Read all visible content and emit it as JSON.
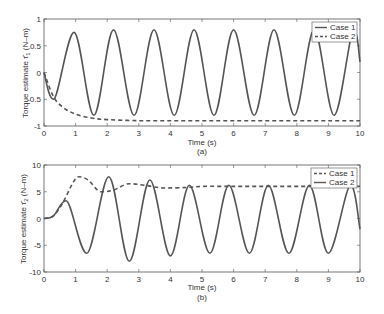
{
  "chart_data": [
    {
      "type": "line",
      "panel_label": "(a)",
      "xlabel": "Time (s)",
      "ylabel": "Torque estimate τ̂1 (N–m)",
      "xlim": [
        0,
        10
      ],
      "ylim": [
        -1,
        1
      ],
      "xticks": [
        0,
        1,
        2,
        3,
        4,
        5,
        6,
        7,
        8,
        9,
        10
      ],
      "yticks": [
        -1,
        -0.5,
        0,
        0.5,
        1
      ],
      "ytick_labels": [
        "-1",
        "-0.5",
        "0",
        "0.5",
        "1"
      ],
      "grid": false,
      "legend_position": "upper right",
      "legend": [
        "Case 1",
        "Case 2"
      ],
      "series": [
        {
          "name": "Case 1",
          "style": "solid",
          "x": [
            0,
            0.3,
            0.95,
            1.58,
            2.2,
            2.85,
            3.48,
            4.12,
            4.75,
            5.38,
            6.0,
            6.65,
            7.28,
            7.92,
            8.55,
            9.18,
            9.8,
            10
          ],
          "y": [
            0,
            -0.5,
            0.75,
            -0.8,
            0.8,
            -0.8,
            0.8,
            -0.8,
            0.8,
            -0.8,
            0.8,
            -0.8,
            0.8,
            -0.8,
            0.8,
            -0.8,
            0.8,
            0.2
          ]
        },
        {
          "name": "Case 2",
          "style": "dashed",
          "x": [
            0,
            0.3,
            0.6,
            1.0,
            1.5,
            2,
            3,
            4,
            5,
            6,
            7,
            8,
            9,
            10
          ],
          "y": [
            0,
            -0.45,
            -0.65,
            -0.78,
            -0.85,
            -0.88,
            -0.9,
            -0.9,
            -0.9,
            -0.9,
            -0.9,
            -0.9,
            -0.9,
            -0.9
          ]
        }
      ]
    },
    {
      "type": "line",
      "panel_label": "(b)",
      "xlabel": "Time (s)",
      "ylabel": "Torque estimate τ̂2 (N–m)",
      "xlim": [
        0,
        10
      ],
      "ylim": [
        -10,
        10
      ],
      "xticks": [
        0,
        1,
        2,
        3,
        4,
        5,
        6,
        7,
        8,
        9,
        10
      ],
      "yticks": [
        -10,
        -5,
        0,
        5,
        10
      ],
      "ytick_labels": [
        "-10",
        "-5",
        "0",
        "5",
        "10"
      ],
      "grid": false,
      "legend_position": "upper right",
      "legend": [
        "Case 1",
        "Case 2"
      ],
      "series": [
        {
          "name": "Case 1",
          "style": "dashed",
          "x": [
            0,
            0.3,
            0.6,
            0.9,
            1.1,
            1.4,
            1.8,
            2.2,
            2.7,
            3.2,
            3.8,
            4.5,
            5,
            6,
            7,
            8,
            9,
            10
          ],
          "y": [
            0,
            0.5,
            3,
            6.5,
            7.8,
            7.2,
            5,
            5.3,
            6.5,
            6.2,
            5.7,
            5.8,
            6,
            6,
            6,
            6,
            6,
            6
          ]
        },
        {
          "name": "Case 2",
          "style": "solid",
          "x": [
            0,
            0.3,
            0.7,
            1.35,
            2.05,
            2.7,
            3.35,
            4.0,
            4.6,
            5.25,
            5.85,
            6.5,
            7.1,
            7.75,
            8.4,
            9.0,
            9.7,
            10
          ],
          "y": [
            0,
            0.5,
            3.3,
            -6.5,
            7.8,
            -8,
            7.2,
            -7,
            6.2,
            -6.5,
            6.2,
            -6.5,
            6.2,
            -6.5,
            6.2,
            -6.5,
            6.2,
            -2
          ]
        }
      ]
    }
  ],
  "panels": {
    "a": {
      "label": "(a)",
      "xlabel": "Time (s)",
      "ylabel_prefix": "Torque estimate ",
      "ylabel_sym": "τ̂",
      "ylabel_sub": "1",
      "ylabel_suffix": " (N–m)",
      "legend": [
        "Case 1",
        "Case 2"
      ]
    },
    "b": {
      "label": "(b)",
      "xlabel": "Time (s)",
      "ylabel_prefix": "Torque estimate ",
      "ylabel_sym": "τ̂",
      "ylabel_sub": "2",
      "ylabel_suffix": " (N–m)",
      "legend": [
        "Case 1",
        "Case 2"
      ]
    }
  }
}
